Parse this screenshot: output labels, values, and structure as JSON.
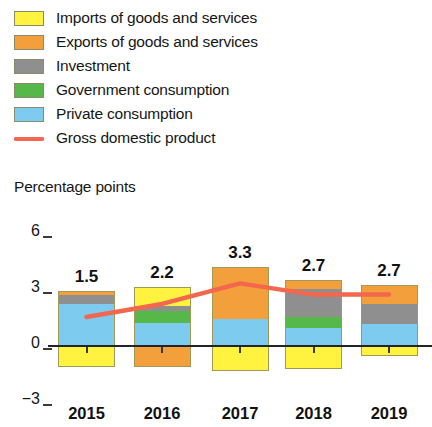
{
  "legend": {
    "items": [
      {
        "label": "Imports of goods and services",
        "color": "#fff33f",
        "icon": "square-swatch"
      },
      {
        "label": "Exports of goods and services",
        "color": "#f3a03c",
        "icon": "square-swatch"
      },
      {
        "label": "Investment",
        "color": "#8f8f8f",
        "icon": "square-swatch"
      },
      {
        "label": "Government consumption",
        "color": "#55b848",
        "icon": "square-swatch"
      },
      {
        "label": "Private consumption",
        "color": "#7ecbf0",
        "icon": "square-swatch"
      },
      {
        "label": "Gross domestic product",
        "color": "#f2674e",
        "icon": "line-swatch"
      }
    ]
  },
  "axis_title": "Percentage points",
  "chart_data": {
    "type": "bar",
    "title": "",
    "subtitle": "",
    "xlabel": "",
    "ylabel": "Percentage points",
    "ylim": [
      -3,
      6
    ],
    "yticks": [
      -3,
      0,
      3,
      6
    ],
    "ytick_labels": [
      "−3",
      "0",
      "3",
      "6"
    ],
    "grid": false,
    "stacked": true,
    "legend_position": "top-left",
    "categories": [
      "2015",
      "2016",
      "2017",
      "2018",
      "2019"
    ],
    "series": [
      {
        "name": "Private consumption",
        "color": "#7ecbf0",
        "values": [
          2.2,
          1.2,
          1.4,
          0.9,
          1.1
        ]
      },
      {
        "name": "Government consumption",
        "color": "#55b848",
        "values": [
          0.0,
          0.6,
          0.0,
          0.6,
          0.0
        ]
      },
      {
        "name": "Investment",
        "color": "#8f8f8f",
        "values": [
          0.5,
          0.3,
          0.0,
          1.5,
          1.1
        ]
      },
      {
        "name": "Exports of goods and services",
        "color": "#f3a03c",
        "values": [
          0.2,
          -1.2,
          2.8,
          0.5,
          1.0
        ]
      },
      {
        "name": "Imports of goods and services",
        "color": "#fff33f",
        "values": [
          -1.2,
          1.0,
          -1.4,
          -1.3,
          -0.6
        ]
      }
    ],
    "line_series": {
      "name": "Gross domestic product",
      "color": "#f2674e",
      "values": [
        1.5,
        2.2,
        3.3,
        2.7,
        2.7
      ]
    },
    "data_labels": [
      "1.5",
      "2.2",
      "3.3",
      "2.7",
      "2.7"
    ]
  }
}
